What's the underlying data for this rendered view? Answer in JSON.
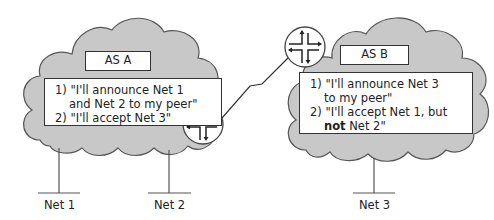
{
  "diagram": {
    "type": "bgp-peering-policy",
    "colors": {
      "cloud_fill": "#c8c8c8",
      "cloud_stroke": "#555555",
      "line": "#333333",
      "background": "#ffffff"
    },
    "as_a": {
      "title": "AS A",
      "policy": {
        "line1": "1) \"I'll announce Net 1",
        "line2": "and Net 2 to my peer\"",
        "line3": "2) \"I'll accept Net 3\""
      },
      "router_icon": "router-icon"
    },
    "as_b": {
      "title": "AS B",
      "policy": {
        "line1": "1) \"I'll announce Net 3",
        "line2": "to my peer\"",
        "line3": "2) \"I'll accept Net 1, but",
        "line4_bold": "not",
        "line4_rest": " Net 2\""
      },
      "router_icon": "router-icon"
    },
    "networks": [
      {
        "label": "Net 1",
        "attached_to": "AS A"
      },
      {
        "label": "Net 2",
        "attached_to": "AS A"
      },
      {
        "label": "Net 3",
        "attached_to": "AS B"
      }
    ],
    "link": {
      "type": "serial-link",
      "between": [
        "AS A router",
        "AS B router"
      ]
    }
  }
}
